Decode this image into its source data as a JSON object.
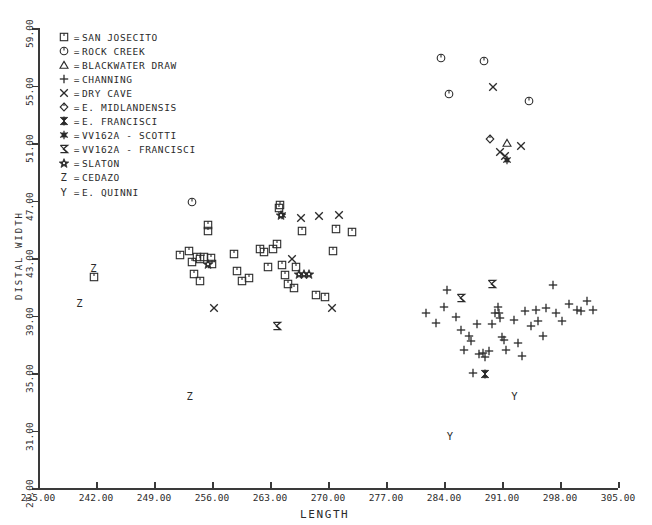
{
  "chart_data": {
    "type": "scatter",
    "title": "",
    "xlabel": "LENGTH",
    "ylabel": "DISTAL WIDTH",
    "xlim": [
      235.0,
      305.0
    ],
    "ylim": [
      27.0,
      59.0
    ],
    "xticks": [
      "235.00",
      "242.00",
      "249.00",
      "256.00",
      "263.00",
      "270.00",
      "277.00",
      "284.00",
      "291.00",
      "298.00",
      "305.00"
    ],
    "yticks": [
      "27.00",
      "31.00",
      "35.00",
      "39.00",
      "43.00",
      "47.00",
      "51.00",
      "55.00",
      "59.00"
    ],
    "grid": false,
    "legend_position": "upper-left",
    "legend": [
      {
        "symbol": "square",
        "eq": "=",
        "label": "SAN JOSECITO"
      },
      {
        "symbol": "circle-bar",
        "eq": "=",
        "label": "ROCK CREEK"
      },
      {
        "symbol": "triangle",
        "eq": "=",
        "label": "BLACKWATER DRAW"
      },
      {
        "symbol": "plus",
        "eq": "=",
        "label": "CHANNING"
      },
      {
        "symbol": "ex",
        "eq": "=",
        "label": "DRY CAVE"
      },
      {
        "symbol": "diamond",
        "eq": "=",
        "label": "E. MIDLANDENSIS"
      },
      {
        "symbol": "bowtie",
        "eq": "=",
        "label": "E. FRANCISCI"
      },
      {
        "symbol": "asterisk",
        "eq": "=",
        "label": "VV162A - SCOTTI"
      },
      {
        "symbol": "sigma",
        "eq": "=",
        "label": "VV162A - FRANCISCI"
      },
      {
        "symbol": "star",
        "eq": "=",
        "label": "SLATON"
      },
      {
        "symbol": "letterZ",
        "eq": "=",
        "label": "CEDAZO"
      },
      {
        "symbol": "letterY",
        "eq": "=",
        "label": "E. QUINNI"
      }
    ],
    "series": [
      {
        "name": "SAN JOSECITO",
        "symbol": "square",
        "points": [
          [
            241.8,
            41.7
          ],
          [
            252.1,
            43.2
          ],
          [
            253.2,
            43.5
          ],
          [
            253.6,
            42.7
          ],
          [
            253.8,
            41.9
          ],
          [
            254.2,
            43.1
          ],
          [
            254.5,
            42.9
          ],
          [
            254.6,
            41.4
          ],
          [
            255.0,
            43.1
          ],
          [
            255.5,
            44.9
          ],
          [
            255.5,
            45.3
          ],
          [
            255.9,
            43.0
          ],
          [
            256.0,
            42.6
          ],
          [
            258.6,
            43.3
          ],
          [
            259.0,
            42.1
          ],
          [
            259.6,
            41.4
          ],
          [
            260.5,
            41.6
          ],
          [
            261.8,
            43.6
          ],
          [
            262.3,
            43.4
          ],
          [
            262.8,
            42.4
          ],
          [
            263.4,
            43.6
          ],
          [
            263.8,
            44.0
          ],
          [
            264.1,
            46.5
          ],
          [
            264.2,
            46.7
          ],
          [
            264.4,
            42.5
          ],
          [
            264.8,
            41.8
          ],
          [
            265.2,
            41.2
          ],
          [
            265.9,
            40.9
          ],
          [
            266.1,
            42.4
          ],
          [
            266.9,
            44.9
          ],
          [
            268.5,
            40.4
          ],
          [
            269.6,
            40.3
          ],
          [
            270.6,
            43.5
          ],
          [
            271.0,
            45.0
          ],
          [
            272.9,
            44.8
          ]
        ]
      },
      {
        "name": "ROCK CREEK",
        "symbol": "circle-bar",
        "points": [
          [
            283.6,
            56.9
          ],
          [
            288.8,
            56.7
          ],
          [
            284.6,
            54.4
          ],
          [
            294.3,
            53.9
          ],
          [
            253.6,
            46.9
          ]
        ]
      },
      {
        "name": "BLACKWATER DRAW",
        "symbol": "triangle",
        "points": [
          [
            291.6,
            51.0
          ]
        ]
      },
      {
        "name": "CHANNING",
        "symbol": "plus",
        "points": [
          [
            281.8,
            39.2
          ],
          [
            283.0,
            38.5
          ],
          [
            284.4,
            40.8
          ],
          [
            285.4,
            38.9
          ],
          [
            286.1,
            38.0
          ],
          [
            286.4,
            36.6
          ],
          [
            287.0,
            37.6
          ],
          [
            287.3,
            37.2
          ],
          [
            287.5,
            35.0
          ],
          [
            288.0,
            38.4
          ],
          [
            288.2,
            36.3
          ],
          [
            288.7,
            36.4
          ],
          [
            289.0,
            36.1
          ],
          [
            289.4,
            36.5
          ],
          [
            289.8,
            38.4
          ],
          [
            290.2,
            39.2
          ],
          [
            290.5,
            39.6
          ],
          [
            290.6,
            39.2
          ],
          [
            290.7,
            38.8
          ],
          [
            291.0,
            37.5
          ],
          [
            291.2,
            37.3
          ],
          [
            291.5,
            36.6
          ],
          [
            292.5,
            38.7
          ],
          [
            292.9,
            37.1
          ],
          [
            293.4,
            36.2
          ],
          [
            293.8,
            39.3
          ],
          [
            294.5,
            38.3
          ],
          [
            295.1,
            39.4
          ],
          [
            295.4,
            38.6
          ],
          [
            296.0,
            37.6
          ],
          [
            296.3,
            39.5
          ],
          [
            297.2,
            41.1
          ],
          [
            297.5,
            39.2
          ],
          [
            298.3,
            38.6
          ],
          [
            299.1,
            39.8
          ],
          [
            300.0,
            39.4
          ],
          [
            300.5,
            39.3
          ],
          [
            301.3,
            40.0
          ],
          [
            302.0,
            39.4
          ],
          [
            284.0,
            39.6
          ]
        ]
      },
      {
        "name": "DRY CAVE",
        "symbol": "ex",
        "points": [
          [
            289.9,
            54.9
          ],
          [
            290.8,
            50.4
          ],
          [
            291.4,
            50.1
          ],
          [
            293.3,
            50.8
          ],
          [
            266.8,
            45.8
          ],
          [
            268.9,
            45.9
          ],
          [
            271.3,
            46.0
          ],
          [
            265.7,
            42.9
          ],
          [
            270.5,
            39.5
          ],
          [
            256.3,
            39.5
          ]
        ]
      },
      {
        "name": "E. MIDLANDENSIS",
        "symbol": "diamond",
        "points": [
          [
            289.6,
            51.3
          ]
        ]
      },
      {
        "name": "E. FRANCISCI",
        "symbol": "bowtie",
        "points": [
          [
            288.9,
            34.9
          ]
        ]
      },
      {
        "name": "VV162A - SCOTTI",
        "symbol": "asterisk",
        "points": [
          [
            291.6,
            49.8
          ],
          [
            264.4,
            46.0
          ]
        ]
      },
      {
        "name": "VV162A - FRANCISCI",
        "symbol": "sigma",
        "points": [
          [
            289.8,
            41.2
          ],
          [
            286.1,
            40.2
          ],
          [
            263.9,
            38.3
          ]
        ]
      },
      {
        "name": "SLATON",
        "symbol": "star",
        "points": [
          [
            264.3,
            46.0
          ],
          [
            255.5,
            42.6
          ],
          [
            266.5,
            41.9
          ],
          [
            267.1,
            41.9
          ],
          [
            267.7,
            41.9
          ]
        ]
      },
      {
        "name": "CEDAZO",
        "symbol": "letterZ",
        "points": [
          [
            241.7,
            42.3
          ],
          [
            240.0,
            39.9
          ],
          [
            253.3,
            33.4
          ]
        ]
      },
      {
        "name": "E. QUINNI",
        "symbol": "letterY",
        "points": [
          [
            292.5,
            33.4
          ],
          [
            284.7,
            30.6
          ]
        ]
      }
    ]
  }
}
